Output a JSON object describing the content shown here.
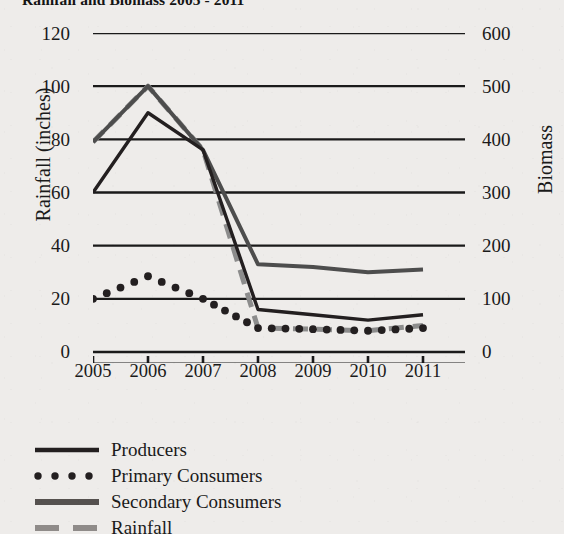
{
  "chart_data": {
    "type": "line",
    "title": "Rainfall and Biomass 2005 - 2011",
    "xlabel": "",
    "ylabel": "Rainfall (inches)",
    "y2label": "Biomass",
    "categories": [
      "2005",
      "2006",
      "2007",
      "2008",
      "2009",
      "2010",
      "2011"
    ],
    "x": [
      2005,
      2006,
      2007,
      2008,
      2009,
      2010,
      2011
    ],
    "ylim": [
      0,
      120
    ],
    "yticks": [
      0,
      20,
      40,
      60,
      80,
      100,
      120
    ],
    "y2lim": [
      0,
      600
    ],
    "y2ticks": [
      0,
      100,
      200,
      300,
      400,
      500,
      600
    ],
    "grid": true,
    "grid_axis": "y",
    "legend_position": "below-left",
    "series": [
      {
        "name": "Producers",
        "axis": "right",
        "style": "solid",
        "color": "#231f20",
        "width": 3.4,
        "values": [
          300,
          450,
          380,
          80,
          70,
          60,
          70
        ],
        "left_scale_values": [
          60,
          90,
          76,
          16,
          14,
          12,
          14
        ]
      },
      {
        "name": "Primary Consumers",
        "axis": "right",
        "style": "dotted",
        "color": "#231f20",
        "width": 5.0,
        "values": [
          100,
          143,
          100,
          45,
          43,
          40,
          45
        ],
        "left_scale_values": [
          20,
          28.5,
          20,
          9,
          8.6,
          8,
          9
        ]
      },
      {
        "name": "Secondary Consumers",
        "axis": "left",
        "style": "solid",
        "color": "#4d4d4d",
        "width": 4.0,
        "values": [
          79,
          100,
          76,
          33,
          32,
          30,
          31
        ],
        "left_scale_values": [
          79,
          100,
          76,
          33,
          32,
          30,
          31
        ]
      },
      {
        "name": "Rainfall",
        "axis": "left",
        "style": "dashed",
        "color": "#8c8c8c",
        "width": 5.0,
        "values": [
          79,
          100,
          76,
          9,
          8.6,
          8,
          10
        ],
        "left_scale_values": [
          79,
          100,
          76,
          9,
          8.6,
          8,
          10
        ]
      }
    ],
    "colors": {
      "producers": "#231f20",
      "primary_consumers": "#231f20",
      "secondary_consumers": "#4d4d4d",
      "rainfall": "#8c8c8c",
      "axis": "#1a1a1a",
      "grid": "#1a1a1a",
      "background": "#eeecea"
    }
  },
  "axes": {
    "left": {
      "title": "Rainfall (inches)",
      "ticks": [
        "120",
        "100",
        "80",
        "60",
        "40",
        "20",
        "0"
      ]
    },
    "right": {
      "title": "Biomass",
      "ticks": [
        "600",
        "500",
        "400",
        "300",
        "200",
        "100",
        "0"
      ]
    },
    "bottom": {
      "ticks": [
        "2005",
        "2006",
        "2007",
        "2008",
        "2009",
        "2010",
        "2011"
      ]
    }
  },
  "legend": {
    "items": [
      {
        "label": "Producers",
        "style": "solid",
        "color": "#231f20"
      },
      {
        "label": "Primary Consumers",
        "style": "dotted",
        "color": "#231f20"
      },
      {
        "label": "Secondary Consumers",
        "style": "solid-thick",
        "color": "#4d4d4d"
      },
      {
        "label": "Rainfall",
        "style": "dashed",
        "color": "#8c8c8c"
      }
    ]
  }
}
